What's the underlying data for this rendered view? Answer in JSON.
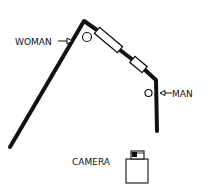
{
  "labels": {
    "woman": "WOMAN",
    "man": "MAN",
    "camera": "CAMERA"
  },
  "colors": {
    "ink": "#111111",
    "background": "#ffffff"
  }
}
